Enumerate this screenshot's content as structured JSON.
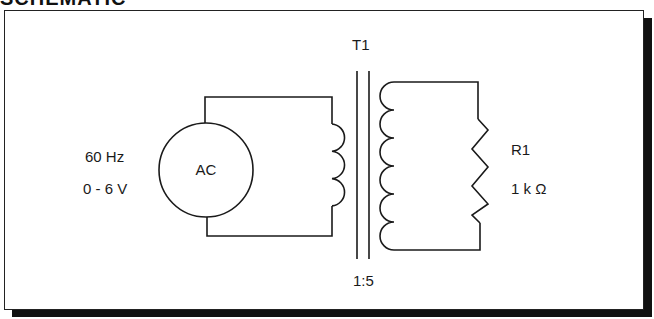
{
  "header": {
    "title": "SCHEMATIC"
  },
  "source": {
    "label": "AC",
    "frequency": "60 Hz",
    "voltage": "0 - 6 V"
  },
  "transformer": {
    "name": "T1",
    "ratio": "1:5",
    "primary_turns_drawn": 3,
    "secondary_turns_drawn": 6
  },
  "load": {
    "name": "R1",
    "value": "1 k Ω"
  },
  "colors": {
    "line": "#1a1a1a",
    "background": "#ffffff",
    "shadow": "#111111"
  }
}
